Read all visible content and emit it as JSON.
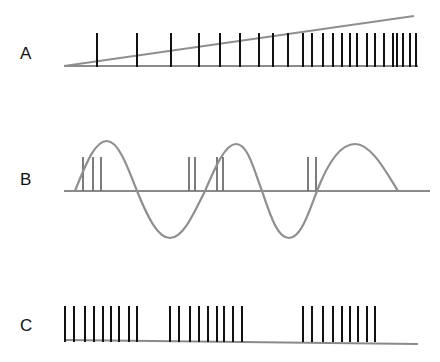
{
  "panels": [
    {
      "label": "A",
      "label_pos": [
        20,
        46
      ],
      "description": "Spike train with increasing firing rate following a linear ramp",
      "baseline": {
        "x1": 64,
        "y1": 66,
        "x2": 418,
        "y2": 66
      },
      "ramp": {
        "x1": 64,
        "y1": 66,
        "x2": 414,
        "y2": 16
      },
      "spike_top": 33,
      "spike_bottom": 67,
      "spikes_x": [
        97,
        137,
        171,
        199,
        220,
        240,
        259,
        273,
        288,
        303,
        312,
        323,
        333,
        342,
        350,
        357,
        367,
        375,
        384,
        393,
        397,
        403,
        410,
        416
      ]
    },
    {
      "label": "B",
      "label_pos": [
        20,
        172
      ],
      "description": "Spike bursts phase-locked to a sinusoidal oscillation",
      "baseline": {
        "x1": 64,
        "y1": 191,
        "x2": 430,
        "y2": 191
      },
      "sine_path": "M75,191 C88,158 96,141 107,141 C118,141 127,165 137,191 C148,218 158,238 170,238 C183,238 193,215 205,191 C215,168 225,144 236,144 C248,144 254,170 262,191 C270,214 277,238 289,238 C301,238 309,212 317,191 C327,165 340,144 355,144 C371,144 385,170 398,191",
      "spike_top": 157,
      "spike_bottom": 191,
      "spikes_x": [
        83,
        93,
        101,
        189,
        195,
        217,
        223,
        308,
        316
      ]
    },
    {
      "label": "C",
      "label_pos": [
        20,
        318
      ],
      "description": "Periodic bursting spike train",
      "baseline": {
        "x1": 64,
        "y1": 340,
        "x2": 418,
        "y2": 344
      },
      "spike_top": 306,
      "spike_bottom": 342,
      "bursts": [
        [
          65,
          74,
          85,
          94,
          103,
          111,
          119,
          129,
          137
        ],
        [
          170,
          179,
          190,
          199,
          208,
          217,
          224,
          233,
          242
        ],
        [
          303,
          312,
          323,
          333,
          342,
          350,
          358,
          367,
          375
        ]
      ]
    }
  ],
  "colors": {
    "spike": "#111111",
    "baseline": "#8a8a8a",
    "curve": "#8f8f8f",
    "spike_gray": "#6e6e6e"
  }
}
